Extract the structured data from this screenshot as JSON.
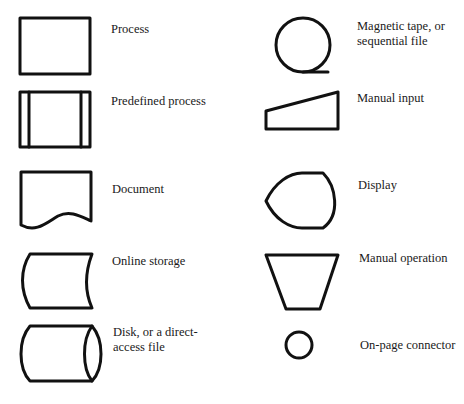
{
  "left_column": [
    {
      "symbol": "process-rectangle",
      "label": "Process"
    },
    {
      "symbol": "predefined-process",
      "label": "Predefined process"
    },
    {
      "symbol": "document",
      "label": "Document"
    },
    {
      "symbol": "online-storage",
      "label": "Online storage"
    },
    {
      "symbol": "disk-cylinder",
      "label": "Disk, or a direct-\naccess file"
    }
  ],
  "right_column": [
    {
      "symbol": "magnetic-tape",
      "label": "Magnetic tape, or\nsequential file"
    },
    {
      "symbol": "manual-input",
      "label": "Manual input"
    },
    {
      "symbol": "display",
      "label": "Display"
    },
    {
      "symbol": "manual-operation",
      "label": "Manual operation"
    },
    {
      "symbol": "on-page-connector",
      "label": "On-page connector"
    }
  ]
}
